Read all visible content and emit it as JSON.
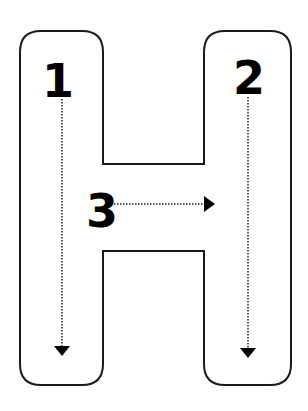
{
  "diagram": {
    "letter": "H",
    "outline_color": "#1a1a1a",
    "strokes": [
      {
        "label": "1",
        "direction": "down",
        "part": "left stem"
      },
      {
        "label": "2",
        "direction": "down",
        "part": "right stem"
      },
      {
        "label": "3",
        "direction": "right",
        "part": "crossbar"
      }
    ]
  }
}
